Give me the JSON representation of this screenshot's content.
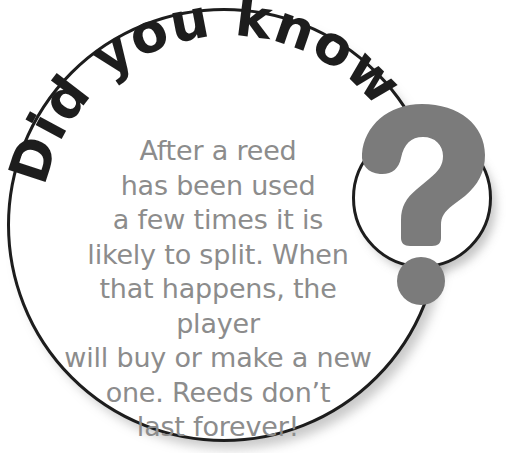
{
  "callout": {
    "headline": "Did you know",
    "body": "After a reed\nhas been used\na few times it is\nlikely to split. When\nthat happens, the player\nwill buy or make a new\none. Reeds don’t\nlast forever!",
    "badge_symbol": "?",
    "colors": {
      "outline": "#1d1d1d",
      "headline_text": "#1d1d1d",
      "body_text": "#8c8c8c",
      "question_mark": "#7b7b7b",
      "background": "#ffffff"
    }
  }
}
